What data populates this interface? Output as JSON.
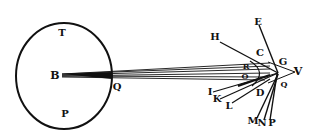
{
  "figure": {
    "circle_labels": {
      "top": "T",
      "center": "B",
      "bottom": "P",
      "right": "Q"
    },
    "ray_labels": {
      "E": "E",
      "H": "H",
      "C": "C",
      "G": "G",
      "V": "V",
      "R": "R",
      "O": "O",
      "I": "I",
      "K": "K",
      "L": "L",
      "D": "D",
      "Q2": "Q",
      "M": "M",
      "N": "N",
      "P2": "P"
    },
    "colors": {
      "ink": "#111111",
      "paper": "#ffffff"
    }
  }
}
